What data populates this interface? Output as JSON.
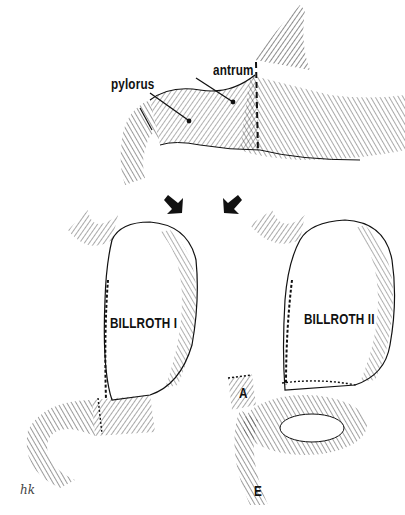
{
  "figure": {
    "top_panel": {
      "description": "stomach with dashed resection line",
      "labels": {
        "antrum": "antrum",
        "pylorus": "pylorus"
      }
    },
    "arrows": [
      {
        "direction": "down-left"
      },
      {
        "direction": "down-right"
      }
    ],
    "left_panel": {
      "title": "BILLROTH I"
    },
    "right_panel": {
      "title": "BILLROTH II",
      "labels": {
        "afferent_limb": "A",
        "efferent_limb": "E"
      }
    },
    "signature": "hk"
  },
  "colors": {
    "ink": "#111111",
    "background": "#ffffff"
  }
}
